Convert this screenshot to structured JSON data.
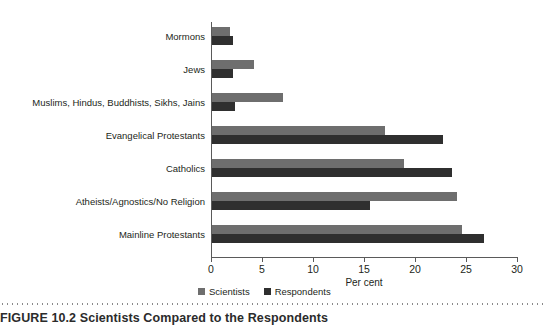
{
  "chart_data": {
    "type": "bar",
    "orientation": "horizontal",
    "title": "",
    "xlabel": "Per cent",
    "ylabel": "",
    "xlim": [
      0,
      30
    ],
    "xticks": [
      0,
      5,
      10,
      15,
      20,
      25,
      30
    ],
    "grid": false,
    "legend_position": "bottom-left",
    "categories": [
      "Mormons",
      "Jews",
      "Muslims, Hindus, Buddhists, Sikhs, Jains",
      "Evangelical Protestants",
      "Catholics",
      "Atheists/Agnostics/No Religion",
      "Mainline Protestants"
    ],
    "series": [
      {
        "name": "Scientists",
        "color": "#6e6e6e",
        "values": [
          1.8,
          4.1,
          7.0,
          17.0,
          18.8,
          24.0,
          24.5
        ]
      },
      {
        "name": "Respondents",
        "color": "#2f2f2f",
        "values": [
          2.1,
          2.1,
          2.3,
          22.6,
          23.5,
          15.5,
          26.7
        ]
      }
    ]
  },
  "axis": {
    "x_label": "Per cent",
    "tick_labels": [
      "0",
      "5",
      "10",
      "15",
      "20",
      "25",
      "30"
    ]
  },
  "legend": {
    "items": [
      {
        "label": "Scientists",
        "color": "#6e6e6e"
      },
      {
        "label": "Respondents",
        "color": "#2f2f2f"
      }
    ]
  },
  "caption": {
    "figure_number": "FIGURE 10.2",
    "text": "Scientists Compared to the Respondents"
  }
}
